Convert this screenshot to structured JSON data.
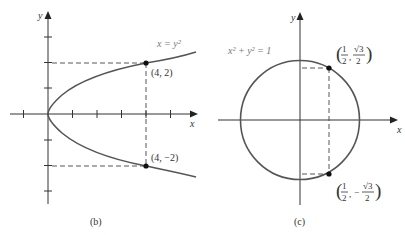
{
  "panels": [
    {
      "id": "b",
      "caption": "(b)",
      "equation": "x = y²",
      "axis_labels": {
        "x": "x",
        "y": "y"
      },
      "points": [
        {
          "label": "(4, 2)",
          "x": 4,
          "y": 2
        },
        {
          "label": "(4, −2)",
          "x": 4,
          "y": -2
        }
      ],
      "x_ticks": [
        -1,
        1,
        2,
        3,
        4,
        5
      ],
      "y_ticks": [
        -3,
        -2,
        -1,
        1,
        2,
        3
      ]
    },
    {
      "id": "c",
      "caption": "(c)",
      "equation": "x² + y² = 1",
      "axis_labels": {
        "x": "x",
        "y": "y"
      },
      "points": [
        {
          "label_num1": "1",
          "label_den1": "2",
          "label_num2": "√3",
          "label_den2": "2",
          "sign": "",
          "x": 0.5,
          "y": 0.866
        },
        {
          "label_num1": "1",
          "label_den1": "2",
          "label_num2": "√3",
          "label_den2": "2",
          "sign": "−",
          "x": 0.5,
          "y": -0.866
        }
      ]
    }
  ]
}
